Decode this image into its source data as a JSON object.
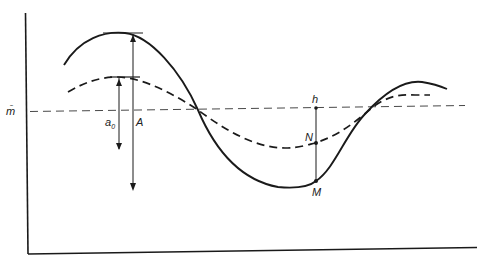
{
  "figure": {
    "labels": {
      "mean": "m̄",
      "a0": "a",
      "a0_sub": "0",
      "A": "A",
      "h": "h",
      "N": "N",
      "M": "M"
    },
    "colors": {
      "ink": "#1a1a1a",
      "background": "#ffffff"
    },
    "curves": [
      {
        "name": "large-amplitude-wave",
        "style": "solid",
        "peak_label": "A"
      },
      {
        "name": "small-amplitude-wave",
        "style": "dashed",
        "peak_label": "a0"
      },
      {
        "name": "mean-level-line",
        "style": "dashed-thin",
        "label": "m̄"
      }
    ],
    "points": [
      "h",
      "N",
      "M"
    ]
  }
}
